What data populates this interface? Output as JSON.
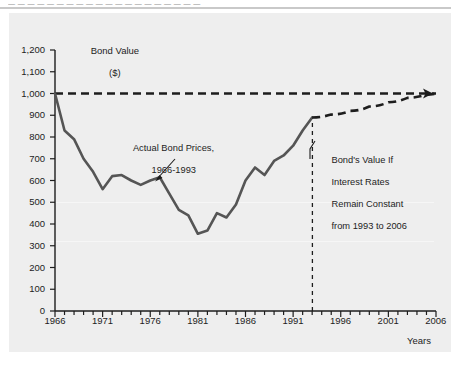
{
  "header": {
    "strip_text": "— — — — —   — — — — — —   — — — —   — — — — —"
  },
  "chart_data": {
    "type": "line",
    "title": "",
    "ylabel": "Bond Value\n($)",
    "ylabel_line1": "Bond Value",
    "ylabel_line2": "($)",
    "xlabel": "Years",
    "xlim": [
      1966,
      2006
    ],
    "ylim": [
      0,
      1200
    ],
    "grid": false,
    "y_ticks": [
      0,
      100,
      200,
      300,
      400,
      500,
      600,
      700,
      800,
      900,
      1000,
      1100,
      1200
    ],
    "y_tick_labels": [
      "0",
      "100",
      "200",
      "300",
      "400",
      "500",
      "600",
      "700",
      "800",
      "900",
      "1,000",
      "1,100",
      "1,200"
    ],
    "x_ticks": [
      1966,
      1971,
      1976,
      1981,
      1986,
      1991,
      1996,
      2001,
      2006
    ],
    "x_tick_labels": [
      "1966",
      "1971",
      "1976",
      "1981",
      "1986",
      "1991",
      "1996",
      "2001",
      "2006"
    ],
    "x_minor_tick_interval": 1,
    "series": [
      {
        "name": "Actual Bond Prices, 1966-1993",
        "style": "solid",
        "color": "#555555",
        "x": [
          1966,
          1967,
          1968,
          1969,
          1970,
          1971,
          1972,
          1973,
          1974,
          1975,
          1976,
          1977,
          1978,
          1979,
          1980,
          1981,
          1982,
          1983,
          1984,
          1985,
          1986,
          1987,
          1988,
          1989,
          1990,
          1991,
          1992,
          1993
        ],
        "y": [
          1000,
          830,
          790,
          700,
          640,
          560,
          620,
          625,
          600,
          580,
          600,
          615,
          540,
          465,
          440,
          355,
          370,
          450,
          430,
          490,
          600,
          660,
          625,
          690,
          715,
          760,
          830,
          890
        ]
      },
      {
        "name": "Bond's Value If Interest Rates Remain Constant from 1993 to 2006",
        "style": "dashed",
        "color": "#1d1d1d",
        "x": [
          1993,
          1995,
          1997,
          1999,
          2001,
          2003,
          2005,
          2006
        ],
        "y": [
          890,
          903,
          920,
          940,
          960,
          980,
          995,
          1000
        ]
      },
      {
        "name": "Par value reference",
        "style": "dashed",
        "color": "#1d1d1d",
        "x": [
          1966,
          2006
        ],
        "y": [
          1000,
          1000
        ]
      }
    ],
    "vertical_marker": {
      "label": "1993",
      "x": 1993,
      "y_from": 0,
      "y_to": 890,
      "style": "dashed"
    },
    "annotations": [
      {
        "name": "actual-bond-prices",
        "text": "Actual Bond Prices,\n1966-1993",
        "line1": "Actual Bond Prices,",
        "line2": "1966-1993",
        "points_to_x": 1980,
        "points_to_y": 620
      },
      {
        "name": "projected-bond-value",
        "text": "Bond's Value If\nInterest Rates\nRemain Constant\nfrom 1993 to 2006",
        "line1": "Bond's Value If",
        "line2": "Interest Rates",
        "line3": "Remain Constant",
        "line4": "from 1993 to 2006"
      }
    ],
    "colors": {
      "panel_background": "#eeeeee",
      "actual_line": "#555555",
      "dashed_line": "#1d1d1d",
      "axis": "#1d1d1d",
      "text": "#1d1d1d"
    }
  }
}
